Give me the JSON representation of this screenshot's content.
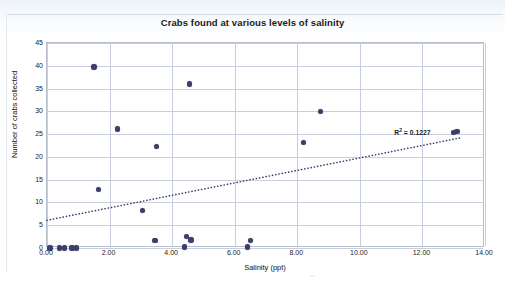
{
  "chart_data": {
    "type": "scatter",
    "title": "Crabs found at various levels of salinity",
    "xlabel": "Salinity (ppt)",
    "ylabel": "Number of crabs collected",
    "xlim": [
      0,
      14
    ],
    "ylim": [
      0,
      45
    ],
    "xticks": [
      "0.00",
      "2.00",
      "4.00",
      "6.00",
      "8.00",
      "10.00",
      "12.00",
      "14.00"
    ],
    "xtick_values": [
      0,
      2,
      4,
      6,
      8,
      10,
      12,
      14
    ],
    "yticks": [
      "0",
      "5",
      "10",
      "15",
      "20",
      "25",
      "30",
      "35",
      "40",
      "45"
    ],
    "ytick_values": [
      0,
      5,
      10,
      15,
      20,
      25,
      30,
      35,
      40,
      45
    ],
    "grid": true,
    "legend": false,
    "marker_color": "#3e3e6e",
    "points": [
      {
        "x": 0.1,
        "y": 0
      },
      {
        "x": 0.4,
        "y": 0
      },
      {
        "x": 0.55,
        "y": 0
      },
      {
        "x": 0.8,
        "y": 0
      },
      {
        "x": 0.95,
        "y": 0
      },
      {
        "x": 1.5,
        "y": 39.7
      },
      {
        "x": 1.65,
        "y": 12.8
      },
      {
        "x": 2.25,
        "y": 26.1
      },
      {
        "x": 3.05,
        "y": 8.3
      },
      {
        "x": 3.45,
        "y": 1.6
      },
      {
        "x": 3.5,
        "y": 22.3
      },
      {
        "x": 4.4,
        "y": 0.2
      },
      {
        "x": 4.45,
        "y": 2.5
      },
      {
        "x": 4.55,
        "y": 36.0
      },
      {
        "x": 4.6,
        "y": 1.8
      },
      {
        "x": 6.4,
        "y": 0.2
      },
      {
        "x": 6.5,
        "y": 1.7
      },
      {
        "x": 8.2,
        "y": 23.1
      },
      {
        "x": 8.75,
        "y": 30.0
      },
      {
        "x": 13.0,
        "y": 25.3
      },
      {
        "x": 13.1,
        "y": 25.6
      }
    ],
    "trendline": {
      "style": "dotted",
      "x_start": 0,
      "y_start": 5.7,
      "x_end": 13.3,
      "y_end": 24.0,
      "r_squared_label": "R² = 0.1227",
      "r_squared_value": 0.1227
    }
  }
}
